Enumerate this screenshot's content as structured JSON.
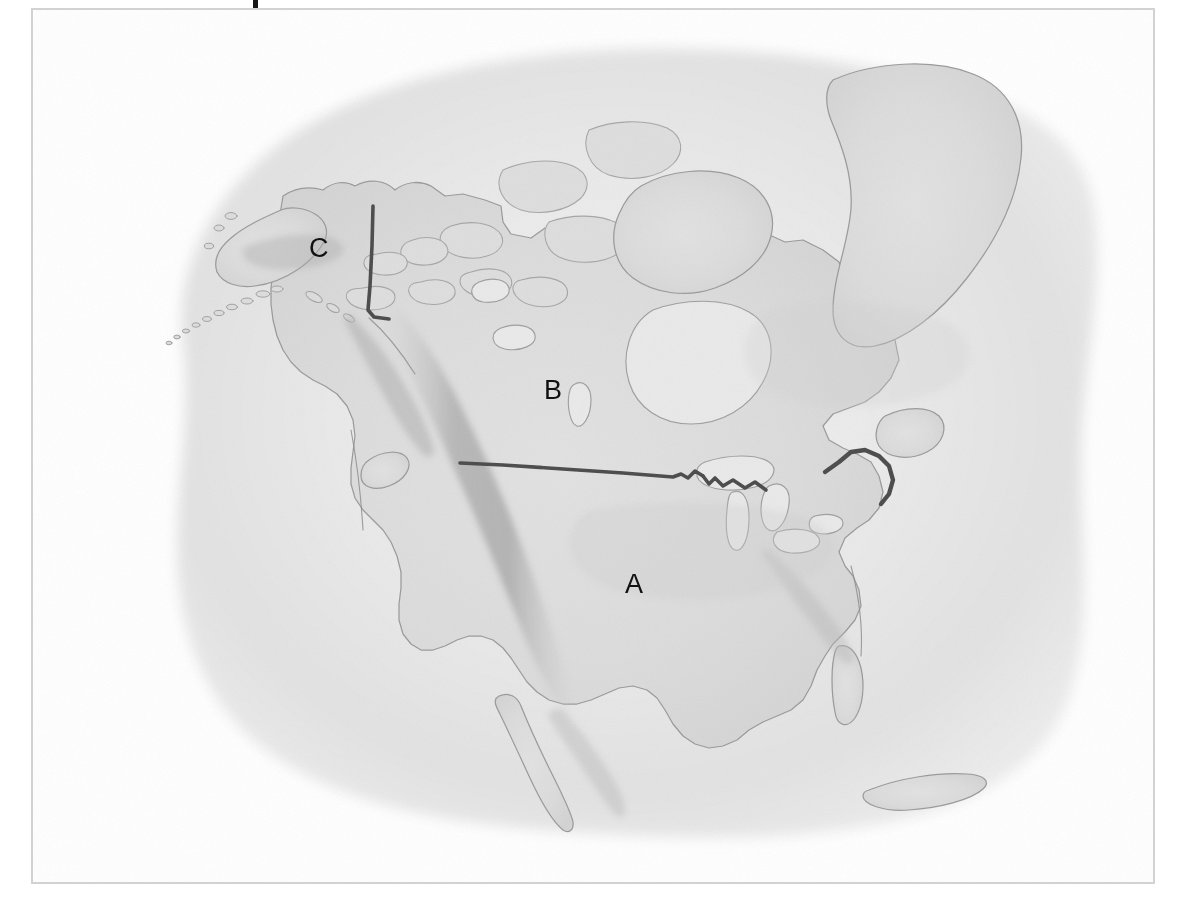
{
  "figure": {
    "kind": "map",
    "region": "North America",
    "style": "grayscale pencil / watercolor wash reference map",
    "frame_color": "#d2d2d2",
    "background_color": "#ffffff",
    "ocean_wash_color": "#e6e6e6",
    "land_fill_color": "#dcdcdc",
    "coastline_color": "#9a9a9a",
    "border_line_color": "#4a4a4a",
    "mountain_shade_color": "#b4b4b4",
    "label_color": "#111111"
  },
  "caption": {
    "cut_off_mark": "",
    "note": "partial descender stroke of clipped caption text at top edge"
  },
  "labels": [
    {
      "id": "A",
      "text": "A",
      "x": 625,
      "y": 588,
      "refers_to": "United States"
    },
    {
      "id": "B",
      "text": "B",
      "x": 544,
      "y": 394,
      "refers_to": "Canada"
    },
    {
      "id": "C",
      "text": "C",
      "x": 309,
      "y": 252,
      "refers_to": "Alaska"
    }
  ],
  "map_features": {
    "highlighted_boundaries": [
      "Alaska – Yukon border (141°W meridian)",
      "United States – Canada border (49th parallel)",
      "Great Lakes / St. Lawrence boundary",
      "Maine – Quebec / New Brunswick boundary"
    ],
    "shaded_relief": [
      "Rocky Mountains",
      "Alaska Range",
      "Appalachian Mountains",
      "Sierra Madre Occidental"
    ],
    "water_bodies": [
      "Hudson Bay",
      "Great Lakes",
      "Gulf of Mexico",
      "Gulf of Alaska",
      "Atlantic Ocean",
      "Pacific Ocean"
    ],
    "landmasses": [
      "Greenland",
      "Baffin Island",
      "Canadian Arctic Archipelago",
      "Newfoundland",
      "Vancouver Island",
      "Baja California",
      "Cuba",
      "Aleutian Islands",
      "Florida Peninsula",
      "Yucatán Peninsula"
    ]
  }
}
